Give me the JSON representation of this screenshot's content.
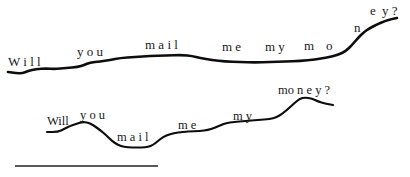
{
  "figure": {
    "type": "intonation-contour-diagram",
    "contours": [
      {
        "id": "contour-1",
        "sentence": "Will you mail me my money?",
        "stroke_width": 2.6,
        "points": [
          [
            8,
            72
          ],
          [
            16,
            73
          ],
          [
            22,
            73.5
          ],
          [
            28,
            71
          ],
          [
            36,
            69
          ],
          [
            46,
            68.5
          ],
          [
            55,
            69
          ],
          [
            66,
            68
          ],
          [
            78,
            67
          ],
          [
            84,
            65
          ],
          [
            90,
            62.5
          ],
          [
            100,
            61.5
          ],
          [
            110,
            60
          ],
          [
            120,
            58
          ],
          [
            135,
            57
          ],
          [
            150,
            56
          ],
          [
            165,
            55.5
          ],
          [
            183,
            55
          ],
          [
            192,
            56
          ],
          [
            200,
            58
          ],
          [
            212,
            60
          ],
          [
            225,
            61.5
          ],
          [
            240,
            62
          ],
          [
            255,
            62.5
          ],
          [
            270,
            62
          ],
          [
            285,
            61.5
          ],
          [
            300,
            61
          ],
          [
            315,
            59.5
          ],
          [
            327,
            57.5
          ],
          [
            338,
            55
          ],
          [
            346,
            51
          ],
          [
            352,
            45
          ],
          [
            358,
            38
          ],
          [
            364,
            32
          ],
          [
            370,
            28
          ],
          [
            378,
            24
          ],
          [
            385,
            21
          ],
          [
            392,
            19
          ],
          [
            397,
            18
          ]
        ],
        "words": [
          {
            "text": "W i l l",
            "x": 8,
            "y": 66,
            "size": 13
          },
          {
            "text": "y o u",
            "x": 77,
            "y": 56,
            "size": 13
          },
          {
            "text": "m a i l",
            "x": 145,
            "y": 49,
            "size": 13
          },
          {
            "text": "m e",
            "x": 222,
            "y": 51,
            "size": 13
          },
          {
            "text": "m y",
            "x": 265,
            "y": 51,
            "size": 13
          },
          {
            "text": "m",
            "x": 304,
            "y": 50,
            "size": 13
          },
          {
            "text": "o",
            "x": 326,
            "y": 50,
            "size": 13
          },
          {
            "text": "n",
            "x": 354,
            "y": 32,
            "size": 13
          },
          {
            "text": "e",
            "x": 370,
            "y": 15,
            "size": 13
          },
          {
            "text": "y ?",
            "x": 382,
            "y": 15,
            "size": 13
          }
        ]
      },
      {
        "id": "contour-2",
        "sentence": "Will you mail me my money?",
        "stroke_width": 2.2,
        "points": [
          [
            47,
            132
          ],
          [
            58,
            132
          ],
          [
            64,
            129
          ],
          [
            70,
            126
          ],
          [
            76,
            124
          ],
          [
            82,
            122
          ],
          [
            88,
            122.5
          ],
          [
            93,
            125
          ],
          [
            100,
            130
          ],
          [
            106,
            135
          ],
          [
            112,
            141
          ],
          [
            118,
            145
          ],
          [
            124,
            147
          ],
          [
            132,
            147.5
          ],
          [
            142,
            147.5
          ],
          [
            148,
            147
          ],
          [
            153,
            145
          ],
          [
            158,
            141
          ],
          [
            163,
            137
          ],
          [
            170,
            134
          ],
          [
            178,
            132.5
          ],
          [
            188,
            131.5
          ],
          [
            200,
            131
          ],
          [
            208,
            130
          ],
          [
            214,
            128
          ],
          [
            220,
            125.5
          ],
          [
            226,
            123
          ],
          [
            234,
            122
          ],
          [
            245,
            121
          ],
          [
            258,
            120
          ],
          [
            270,
            119
          ],
          [
            276,
            117.5
          ],
          [
            282,
            114
          ],
          [
            288,
            109
          ],
          [
            294,
            103.5
          ],
          [
            300,
            98.5
          ],
          [
            305,
            97.5
          ],
          [
            312,
            98.5
          ],
          [
            318,
            101.5
          ],
          [
            325,
            103.5
          ],
          [
            333,
            105
          ]
        ],
        "words": [
          {
            "text": "Will",
            "x": 47,
            "y": 125,
            "size": 12.5
          },
          {
            "text": "y o u",
            "x": 80,
            "y": 119,
            "size": 12.5
          },
          {
            "text": "m a i l",
            "x": 117,
            "y": 141,
            "size": 12.5
          },
          {
            "text": "m e",
            "x": 178,
            "y": 129,
            "size": 12.5
          },
          {
            "text": "m y",
            "x": 233,
            "y": 120,
            "size": 12.5
          },
          {
            "text": "mo n e y ?",
            "x": 278,
            "y": 94,
            "size": 12.5
          }
        ]
      }
    ],
    "scale_bar": {
      "x1": 15,
      "x2": 158,
      "y": 166,
      "stroke_width": 1.4
    }
  }
}
